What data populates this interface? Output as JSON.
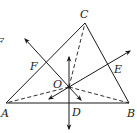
{
  "diagram": {
    "type": "geometry",
    "stroke_color": "#1a1a1a",
    "points": {
      "A": {
        "label": "A",
        "x": 6,
        "y": 103
      },
      "B": {
        "label": "B",
        "x": 129,
        "y": 103
      },
      "C": {
        "label": "C",
        "x": 85,
        "y": 23
      },
      "O": {
        "label": "O",
        "x": 69,
        "y": 87
      },
      "D": {
        "label": "D",
        "x": 69,
        "y": 103
      },
      "E": {
        "label": "E",
        "x": 108,
        "y": 62
      },
      "F": {
        "label": "F",
        "x": 46,
        "y": 63
      }
    },
    "segments_solid": [
      "AB",
      "BC",
      "CA"
    ],
    "segments_dashed": [
      "OA",
      "OB",
      "OC"
    ],
    "bisector_lines": [
      {
        "name": "perpendicular-bisector-AB",
        "through": [
          "D",
          "O"
        ]
      },
      {
        "name": "perpendicular-bisector-BC",
        "through": [
          "E",
          "O"
        ]
      },
      {
        "name": "perpendicular-bisector-CA",
        "through": [
          "F",
          "O"
        ]
      }
    ],
    "edge_fragment_label": "F"
  }
}
